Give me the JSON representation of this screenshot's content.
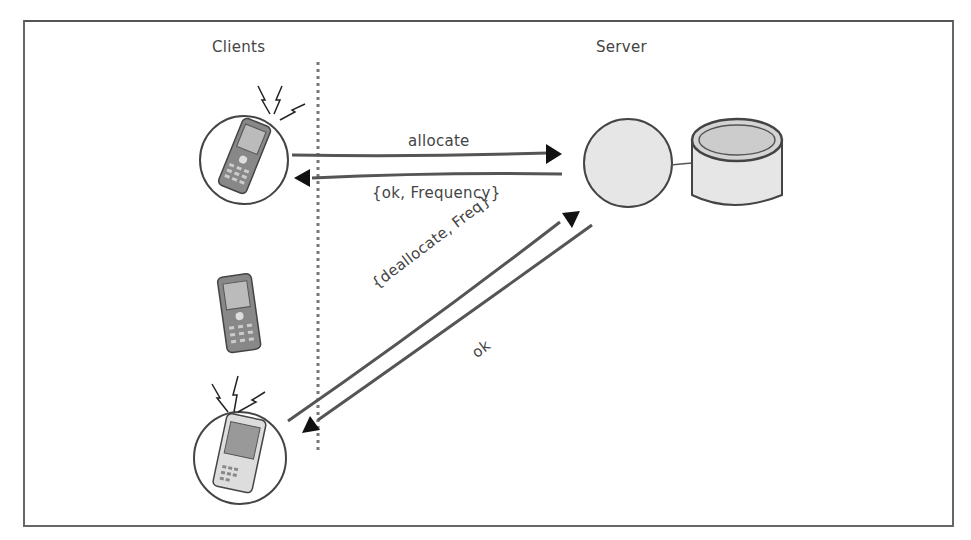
{
  "diagram": {
    "headings": {
      "clients": "Clients",
      "server": "Server"
    },
    "messages": {
      "allocate": "allocate",
      "ok_frequency": "{ok, Frequency}",
      "deallocate": "{deallocate, Freq}",
      "ok": "ok"
    },
    "nodes": [
      {
        "id": "client-1",
        "icon": "mobile-phone-icon",
        "state": "transmitting",
        "circled": true
      },
      {
        "id": "client-2",
        "icon": "mobile-phone-icon",
        "state": "idle",
        "circled": false
      },
      {
        "id": "client-3",
        "icon": "pda-phone-icon",
        "state": "transmitting",
        "circled": true
      },
      {
        "id": "server-process",
        "icon": "process-circle-icon"
      },
      {
        "id": "server-storage",
        "icon": "database-cylinder-icon"
      }
    ],
    "colors": {
      "stroke": "#444444",
      "fill": "#e6e6e6",
      "frame": "#666666",
      "divider": "#777777"
    }
  }
}
